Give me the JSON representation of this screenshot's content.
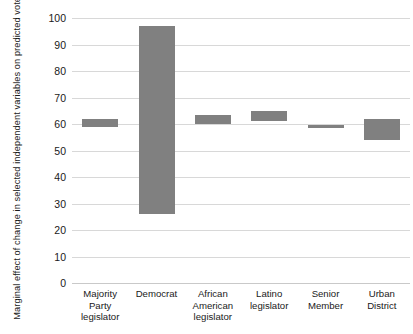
{
  "chart_data": {
    "type": "bar",
    "title": "",
    "subtitle": "",
    "xlabel": "",
    "ylabel": "Marginal effect of change in selected independent variables on predicted vote score",
    "ylim": [
      0,
      100
    ],
    "ytick_labels": [
      "0",
      "10",
      "20",
      "30",
      "40",
      "50",
      "60",
      "70",
      "80",
      "90",
      "100"
    ],
    "ytick_values": [
      0,
      10,
      20,
      30,
      40,
      50,
      60,
      70,
      80,
      90,
      100
    ],
    "grid": true,
    "legend": "none",
    "bar_style": "floating-range",
    "bar_color": "#808080",
    "categories": [
      "Majority Party legislator",
      "Democrat",
      "African American legislator",
      "Latino legislator",
      "Senior Member",
      "Urban District"
    ],
    "category_lines": [
      [
        "Majority",
        "Party",
        "legislator"
      ],
      [
        "Democrat"
      ],
      [
        "African",
        "American",
        "legislator"
      ],
      [
        "Latino",
        "legislator"
      ],
      [
        "Senior",
        "Member"
      ],
      [
        "Urban",
        "District"
      ]
    ],
    "series": [
      {
        "name": "Marginal effect range",
        "low": [
          59.0,
          26.0,
          60.0,
          61.0,
          58.5,
          54.0
        ],
        "high": [
          62.0,
          97.0,
          63.5,
          65.0,
          59.5,
          62.0
        ],
        "values": [
          62.0,
          97.0,
          63.5,
          65.0,
          59.5,
          62.0
        ]
      }
    ]
  },
  "axis": {
    "y_title": "Marginal effect of change in selected independent variables on predicted vote score"
  }
}
